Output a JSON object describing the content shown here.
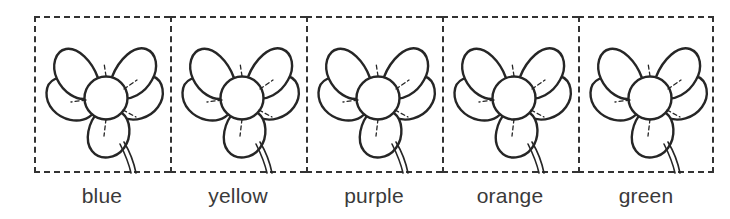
{
  "worksheet": {
    "title": "Flower color labeling worksheet",
    "cell_count": 5,
    "ink_color": "#333333",
    "label_color": "#3a3a3a",
    "background_color": "#ffffff",
    "border_style": "dashed",
    "items": [
      {
        "label": "blue",
        "illustration": "flower-outline"
      },
      {
        "label": "yellow",
        "illustration": "flower-outline"
      },
      {
        "label": "purple",
        "illustration": "flower-outline"
      },
      {
        "label": "orange",
        "illustration": "flower-outline"
      },
      {
        "label": "green",
        "illustration": "flower-outline"
      }
    ]
  }
}
